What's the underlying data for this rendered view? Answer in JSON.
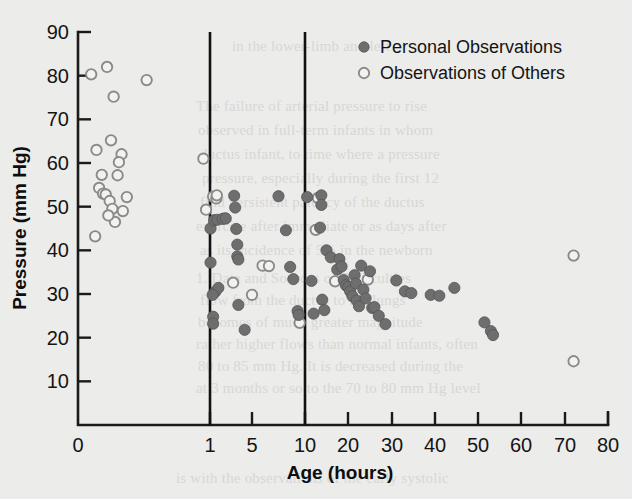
{
  "figure": {
    "background_color": "#ececeb",
    "frame_color": "#1a1a1a"
  },
  "bleed_text": [
    {
      "text": "in the lower-limb and left",
      "x": 232,
      "y": 38
    },
    {
      "text": "The failure of arterial pressure to rise",
      "x": 196,
      "y": 98
    },
    {
      "text": "observed in full-term infants in whom",
      "x": 198,
      "y": 122
    },
    {
      "text": "ductus infant, to time where a pressure",
      "x": 200,
      "y": 146
    },
    {
      "text": "pressure, especially during the first 12",
      "x": 202,
      "y": 170
    },
    {
      "text": "find persistent patency of the ductus",
      "x": 200,
      "y": 194
    },
    {
      "text": "exercise after immediate or as days after",
      "x": 196,
      "y": 218
    },
    {
      "text": "as its incidence of 5% in the newborn",
      "x": 200,
      "y": 242
    },
    {
      "text": "1. Data and Sources of Difficulties",
      "x": 196,
      "y": 270
    },
    {
      "text": "flow from the ductus to the lungs",
      "x": 200,
      "y": 292
    },
    {
      "text": "becomes of much greater magnitude",
      "x": 198,
      "y": 314
    },
    {
      "text": "rather higher flows than normal infants, often",
      "x": 196,
      "y": 336
    },
    {
      "text": "80 to 85 mm Hg. It is decreased during the",
      "x": 198,
      "y": 358
    },
    {
      "text": "at 3 months or so to the 70 to 80 mm Hg level",
      "x": 196,
      "y": 380
    },
    {
      "text": "is with the observations of the early systolic",
      "x": 176,
      "y": 470
    }
  ],
  "chart_data": {
    "type": "scatter",
    "title": "",
    "xlabel": "Age (hours)",
    "ylabel": "Pressure (mm Hg)",
    "xticks": [
      0,
      1,
      5,
      10,
      20,
      30,
      40,
      50,
      60,
      70,
      80
    ],
    "yticks": [
      10,
      20,
      30,
      40,
      50,
      60,
      70,
      80,
      90
    ],
    "ylim": [
      0,
      90
    ],
    "xlim": [
      0,
      80
    ],
    "x_scale": "broken-nonlinear",
    "x_tick_pixels": [
      78,
      210,
      252,
      305,
      348,
      392,
      435,
      478,
      521,
      565,
      608
    ],
    "grid": false,
    "reference_lines": [
      {
        "orientation": "vertical",
        "value": 1,
        "color": "#111111"
      },
      {
        "orientation": "vertical",
        "value": 10,
        "color": "#111111"
      }
    ],
    "legend": {
      "position": "top-right",
      "entries": [
        {
          "label": "Personal Observations",
          "marker": "filled-circle",
          "color": "#6e6e6e"
        },
        {
          "label": "Observations of Others",
          "marker": "open-circle",
          "color": "#f2f2f0"
        }
      ]
    },
    "series": [
      {
        "name": "Observations of Others",
        "marker": "open-circle",
        "points": [
          [
            0.1,
            80.3
          ],
          [
            0.22,
            82.0
          ],
          [
            0.27,
            75.2
          ],
          [
            0.14,
            63.0
          ],
          [
            0.25,
            65.2
          ],
          [
            0.18,
            57.3
          ],
          [
            0.16,
            54.3
          ],
          [
            0.19,
            53.0
          ],
          [
            0.21,
            52.8
          ],
          [
            0.24,
            51.3
          ],
          [
            0.26,
            49.5
          ],
          [
            0.3,
            57.2
          ],
          [
            0.33,
            62.0
          ],
          [
            0.31,
            60.2
          ],
          [
            0.37,
            52.2
          ],
          [
            0.28,
            46.5
          ],
          [
            0.23,
            48.0
          ],
          [
            0.13,
            43.2
          ],
          [
            0.34,
            49.0
          ],
          [
            0.52,
            79.0
          ],
          [
            0.95,
            61.0
          ],
          [
            0.97,
            49.3
          ],
          [
            1.3,
            52.3
          ],
          [
            1.6,
            51.9
          ],
          [
            1.65,
            52.6
          ],
          [
            2.4,
            47.3
          ],
          [
            3.2,
            32.6
          ],
          [
            6.0,
            36.5
          ],
          [
            6.6,
            36.4
          ],
          [
            5.0,
            29.8
          ],
          [
            9.5,
            23.4
          ],
          [
            13.0,
            52.0
          ],
          [
            12.5,
            44.7
          ],
          [
            17.0,
            32.9
          ],
          [
            24.5,
            33.3
          ],
          [
            72.0,
            38.8
          ],
          [
            72.0,
            14.6
          ]
        ]
      },
      {
        "name": "Personal Observations",
        "marker": "filled-circle",
        "points": [
          [
            1.05,
            45.0
          ],
          [
            1.05,
            37.2
          ],
          [
            1.4,
            46.9
          ],
          [
            1.7,
            47.0
          ],
          [
            1.5,
            30.5
          ],
          [
            1.8,
            31.4
          ],
          [
            1.25,
            29.8
          ],
          [
            1.3,
            24.8
          ],
          [
            1.3,
            23.2
          ],
          [
            2.2,
            47.2
          ],
          [
            2.5,
            47.3
          ],
          [
            3.3,
            52.5
          ],
          [
            3.4,
            49.8
          ],
          [
            3.5,
            44.9
          ],
          [
            3.6,
            41.3
          ],
          [
            3.6,
            38.6
          ],
          [
            3.7,
            37.9
          ],
          [
            3.7,
            27.5
          ],
          [
            4.3,
            21.8
          ],
          [
            7.5,
            52.4
          ],
          [
            8.2,
            44.6
          ],
          [
            8.6,
            36.2
          ],
          [
            8.9,
            33.4
          ],
          [
            9.3,
            26.1
          ],
          [
            9.4,
            25.2
          ],
          [
            10.5,
            52.2
          ],
          [
            11.5,
            33.0
          ],
          [
            12.0,
            25.5
          ],
          [
            13.5,
            45.2
          ],
          [
            14.0,
            28.7
          ],
          [
            14.5,
            26.3
          ],
          [
            15.0,
            40.0
          ],
          [
            16.0,
            38.4
          ],
          [
            17.5,
            35.6
          ],
          [
            18.0,
            38.0
          ],
          [
            18.5,
            36.3
          ],
          [
            19.0,
            33.2
          ],
          [
            19.5,
            32.0
          ],
          [
            20.0,
            31.6
          ],
          [
            20.5,
            30.6
          ],
          [
            21.0,
            29.5
          ],
          [
            21.5,
            34.3
          ],
          [
            21.8,
            32.4
          ],
          [
            22.0,
            28.5
          ],
          [
            22.5,
            27.2
          ],
          [
            23.0,
            36.5
          ],
          [
            23.5,
            31.0
          ],
          [
            24.0,
            29.0
          ],
          [
            25.0,
            35.2
          ],
          [
            25.5,
            26.8
          ],
          [
            26.0,
            27.0
          ],
          [
            27.0,
            25.0
          ],
          [
            28.5,
            23.1
          ],
          [
            31.0,
            33.1
          ],
          [
            33.0,
            30.6
          ],
          [
            34.5,
            30.2
          ],
          [
            39.0,
            29.8
          ],
          [
            41.0,
            29.6
          ],
          [
            44.5,
            31.4
          ],
          [
            51.5,
            23.5
          ],
          [
            53.0,
            21.5
          ],
          [
            53.5,
            20.6
          ],
          [
            13.8,
            52.6
          ],
          [
            13.8,
            50.4
          ]
        ]
      }
    ]
  }
}
